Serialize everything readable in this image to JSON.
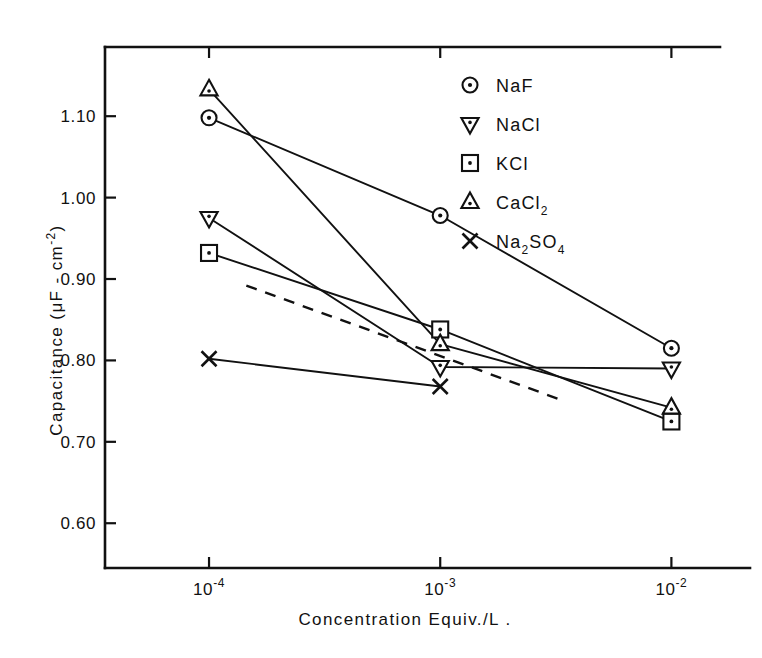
{
  "chart_data": {
    "type": "line",
    "title": "",
    "xlabel": "Concentration  Equiv./L .",
    "ylabel": "Capacitance (μF - cm",
    "ylabel_sup": "-2",
    "ylabel_close": ")",
    "x": [
      0.0001,
      0.001,
      0.01
    ],
    "xtick_labels": [
      "10",
      "10",
      "10"
    ],
    "xtick_exponents": [
      "-4",
      "-3",
      "-2"
    ],
    "ytick_labels": [
      "1.10",
      "1.00",
      "0.90",
      "0.80",
      "0.70",
      "0.60"
    ],
    "ytick_values": [
      1.1,
      1.0,
      0.9,
      0.8,
      0.7,
      0.6
    ],
    "ylim": [
      0.545,
      1.185
    ],
    "xlim_decades": [
      -4.45,
      -1.66
    ],
    "grid": false,
    "legend_position": "top-right",
    "series": [
      {
        "name": "NaF",
        "marker": "circle-dot",
        "x": [
          0.0001,
          0.001,
          0.01
        ],
        "values": [
          1.098,
          0.978,
          0.815
        ],
        "line": "solid"
      },
      {
        "name": "NaCl",
        "marker": "down-triangle-dot",
        "x": [
          0.0001,
          0.001,
          0.01
        ],
        "values": [
          0.975,
          0.792,
          0.79
        ],
        "line": "solid"
      },
      {
        "name": "KCl",
        "marker": "square-dot",
        "x": [
          0.0001,
          0.001,
          0.01
        ],
        "values": [
          0.932,
          0.838,
          0.725
        ],
        "line": "solid"
      },
      {
        "name": "CaCl",
        "name_sub": "2",
        "marker": "up-triangle-dot",
        "x": [
          0.0001,
          0.001,
          0.01
        ],
        "values": [
          1.133,
          0.82,
          0.742
        ],
        "line": "solid"
      },
      {
        "name": "Na",
        "name_sub": "2",
        "name_mid": "SO",
        "name_sub2": "4",
        "marker": "cross-x",
        "x": [
          0.0001,
          0.001
        ],
        "values": [
          0.802,
          0.768
        ],
        "line": "solid"
      },
      {
        "name": "theory",
        "marker": "none",
        "x": [
          0.000145,
          0.0033
        ],
        "values": [
          0.892,
          0.752
        ],
        "line": "dashed"
      }
    ],
    "colors": {
      "ink": "#111111",
      "background": "#ffffff"
    }
  },
  "legend": {
    "entries": [
      {
        "label": "NaF",
        "sub": "",
        "marker": "circle-dot"
      },
      {
        "label": "NaCl",
        "sub": "",
        "marker": "down-triangle-dot"
      },
      {
        "label": "KCl",
        "sub": "",
        "marker": "square-dot"
      },
      {
        "label": "CaCl",
        "sub": "2",
        "marker": "up-triangle-dot"
      },
      {
        "label": "Na",
        "sub": "2",
        "label2": "SO",
        "sub2": "4",
        "marker": "cross-x"
      }
    ]
  }
}
